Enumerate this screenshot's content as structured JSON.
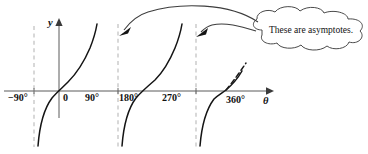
{
  "figure": {
    "kind": "tangent-function-graph",
    "background_color": "#ffffff"
  },
  "axes": {
    "vertical_label": "y",
    "horizontal_label": "θ",
    "origin_label": "0",
    "axis_color": "#5a5a5a"
  },
  "ticks": [
    {
      "label": "−90°",
      "x": 34
    },
    {
      "label": "0",
      "x": 59
    },
    {
      "label": "90°",
      "x": 118
    },
    {
      "label": "180°",
      "x": 157
    },
    {
      "label": "270°",
      "x": 196
    },
    {
      "label": "360°",
      "x": 225
    }
  ],
  "asymptotes": {
    "color": "#b9b9b9",
    "positions": [
      {
        "label": "−90°",
        "x": 34
      },
      {
        "label": "90°",
        "x": 118
      },
      {
        "label": "270°",
        "x": 196
      }
    ]
  },
  "curve": {
    "name": "tangent-curve",
    "color": "#141414",
    "branch_count": 3
  },
  "tangent_segment": {
    "name": "dashed-slope-segment-at-360",
    "color": "#1a1a1a",
    "style": "dashed"
  },
  "callout": {
    "text": "These are asymptotes.",
    "shape": "cloud",
    "fill_color": "#ffffff",
    "stroke_color": "#4a4a4a",
    "arrow_count": 2,
    "arrow_targets": [
      "90° asymptote",
      "270° asymptote"
    ]
  }
}
